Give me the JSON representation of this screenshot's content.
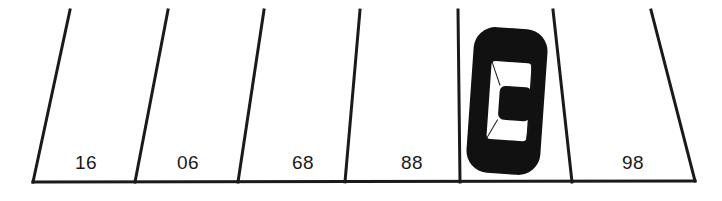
{
  "scene": {
    "title": "Angled parking lot row with one occupied stall",
    "width": 722,
    "height": 201,
    "background_color": "#ffffff",
    "ink_color": "#1a1a1a"
  },
  "curb": {
    "name": "bottom-curb-line",
    "x1": 33,
    "y1": 182,
    "x2": 695,
    "y2": 181,
    "stroke_width": 3
  },
  "stall_dividers": [
    {
      "id": "divider-1",
      "x_top": 70,
      "y_top": 10,
      "x_bottom": 33,
      "y_bottom": 182
    },
    {
      "id": "divider-2",
      "x_top": 168,
      "y_top": 10,
      "x_bottom": 135,
      "y_bottom": 182
    },
    {
      "id": "divider-3",
      "x_top": 264,
      "y_top": 10,
      "x_bottom": 238,
      "y_bottom": 182
    },
    {
      "id": "divider-4",
      "x_top": 360,
      "y_top": 10,
      "x_bottom": 345,
      "y_bottom": 182
    },
    {
      "id": "divider-5",
      "x_top": 458,
      "y_top": 10,
      "x_bottom": 460,
      "y_bottom": 182
    },
    {
      "id": "divider-6",
      "x_top": 553,
      "y_top": 10,
      "x_bottom": 572,
      "y_bottom": 182
    },
    {
      "id": "divider-7",
      "x_top": 651,
      "y_top": 10,
      "x_bottom": 695,
      "y_bottom": 181
    }
  ],
  "stalls": [
    {
      "id": "stall-1",
      "label": "16",
      "label_x": 86,
      "label_y": 169,
      "occupied": false
    },
    {
      "id": "stall-2",
      "label": "06",
      "label_x": 188,
      "label_y": 169,
      "occupied": false
    },
    {
      "id": "stall-3",
      "label": "68",
      "label_x": 303,
      "label_y": 169,
      "occupied": false
    },
    {
      "id": "stall-4",
      "label": "88",
      "label_x": 412,
      "label_y": 169,
      "occupied": false
    },
    {
      "id": "stall-5",
      "label": "",
      "label_x": 515,
      "label_y": 169,
      "occupied": true
    },
    {
      "id": "stall-6",
      "label": "98",
      "label_x": 633,
      "label_y": 169,
      "occupied": false
    }
  ],
  "vehicle": {
    "name": "parked-car",
    "stall_id": "stall-5",
    "orientation": "top-down",
    "body_color": "#111111",
    "window_color": "#ffffff",
    "roof_color": "#111111",
    "body": {
      "x": 470,
      "y": 28,
      "width": 74,
      "height": 146,
      "corner_radius": 22,
      "rotation_deg": 4
    },
    "window": {
      "x": 489,
      "y": 62,
      "width": 40,
      "height": 78,
      "corner_radius": 4
    },
    "roof": {
      "x": 499,
      "y": 86,
      "width": 32,
      "height": 34,
      "corner_radius": 6
    }
  }
}
